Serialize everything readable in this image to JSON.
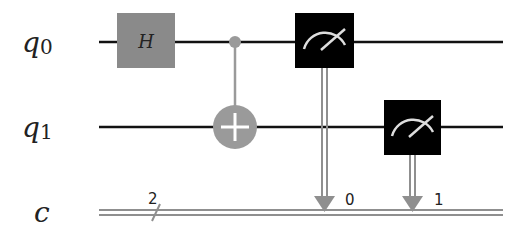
{
  "circuit": {
    "qubits": [
      {
        "name": "q",
        "index": "0"
      },
      {
        "name": "q",
        "index": "1"
      }
    ],
    "classical_register": {
      "name": "c",
      "width": "2"
    },
    "gates": [
      {
        "type": "H",
        "label": "H",
        "qubit": 0
      },
      {
        "type": "CX",
        "control": 0,
        "target": 1
      },
      {
        "type": "measure",
        "qubit": 0,
        "clbit": "0"
      },
      {
        "type": "measure",
        "qubit": 1,
        "clbit": "1"
      }
    ],
    "colors": {
      "wire": "#111111",
      "h_gate": "#8a8a8a",
      "cx": "#9a9a9a",
      "measure_box": "#000000",
      "classical_wire": "#8f8f8f"
    }
  }
}
